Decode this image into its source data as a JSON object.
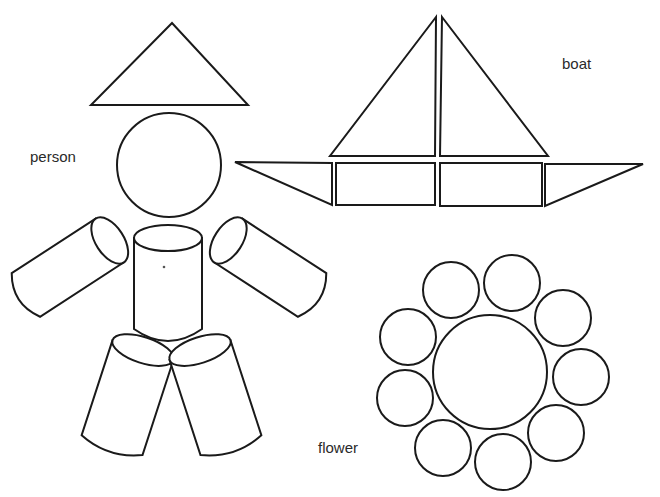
{
  "labels": {
    "person": "person",
    "boat": "boat",
    "flower": "flower"
  },
  "colors": {
    "background": "#ffffff",
    "stroke": "#1a1a1a",
    "text": "#2a2a2a"
  },
  "figures": {
    "person": {
      "parts": [
        "hat-triangle",
        "head-circle",
        "torso-cylinder",
        "left-arm-cylinder",
        "right-arm-cylinder",
        "left-leg-cylinder",
        "right-leg-cylinder"
      ]
    },
    "boat": {
      "parts": [
        "left-sail-triangle",
        "right-sail-triangle",
        "hull-left-triangle",
        "hull-left-rectangle",
        "hull-right-rectangle",
        "hull-right-triangle"
      ]
    },
    "flower": {
      "parts": [
        "center-circle",
        "petal-circle x9"
      ],
      "petal_count": 9
    }
  }
}
